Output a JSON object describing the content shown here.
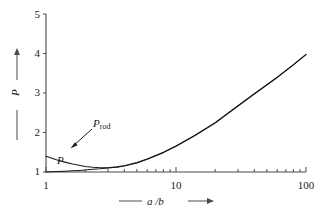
{
  "figure": {
    "background_color": "#ffffff",
    "ink_color": "#1a1a1a"
  },
  "axes": {
    "y": {
      "title": "P",
      "scale": "linear",
      "range": [
        1,
        5
      ],
      "tick_labels": [
        "5",
        "4",
        "3",
        "2",
        "1"
      ],
      "tick_values": [
        5,
        4,
        3,
        2,
        1
      ]
    },
    "x": {
      "title": "a /b",
      "scale": "log",
      "range": [
        1,
        100
      ],
      "tick_labels": [
        "1",
        "10",
        "100"
      ],
      "tick_values": [
        1,
        10,
        100
      ],
      "minor_ticks": [
        2,
        3,
        4,
        5,
        6,
        7,
        8,
        9,
        20,
        30,
        40,
        50,
        60,
        70,
        80,
        90
      ]
    }
  },
  "annotations": {
    "p_rod": {
      "label_main": "P",
      "label_sub": "rod",
      "arrow": "arrow-pointing-down-left-to-curve"
    },
    "p": {
      "label_main": "P"
    }
  },
  "chart_data": {
    "type": "line",
    "title": "",
    "xlabel": "a /b",
    "ylabel": "P",
    "xscale": "log",
    "yscale": "linear",
    "xlim": [
      1,
      100
    ],
    "ylim": [
      1,
      5
    ],
    "xticks": [
      1,
      10,
      100
    ],
    "yticks": [
      1,
      2,
      3,
      4,
      5
    ],
    "grid": false,
    "legend": "none",
    "series": [
      {
        "name": "P_rod",
        "annotation_label": "P rod",
        "x": [
          1,
          1.2,
          1.4,
          1.6,
          1.8,
          2.0,
          2.3,
          2.6,
          3.0,
          3.5,
          4.0,
          5.0,
          6.0,
          8.0,
          10,
          14,
          20,
          30,
          40,
          60,
          80,
          100
        ],
        "y": [
          1.4,
          1.31,
          1.25,
          1.2,
          1.17,
          1.14,
          1.12,
          1.11,
          1.11,
          1.13,
          1.16,
          1.24,
          1.33,
          1.5,
          1.66,
          1.93,
          2.25,
          2.68,
          2.98,
          3.4,
          3.72,
          3.98
        ]
      },
      {
        "name": "P",
        "annotation_label": "P",
        "x": [
          1,
          1.2,
          1.4,
          1.6,
          1.8,
          2.0,
          2.3,
          2.6,
          3.0,
          3.5,
          4.0,
          5.0,
          6.0,
          8.0,
          10,
          14,
          20,
          30,
          40,
          60,
          80,
          100
        ],
        "y": [
          1.0,
          1.01,
          1.02,
          1.03,
          1.04,
          1.05,
          1.07,
          1.08,
          1.1,
          1.12,
          1.15,
          1.23,
          1.32,
          1.49,
          1.65,
          1.92,
          2.24,
          2.67,
          2.97,
          3.39,
          3.71,
          3.97
        ]
      }
    ]
  }
}
